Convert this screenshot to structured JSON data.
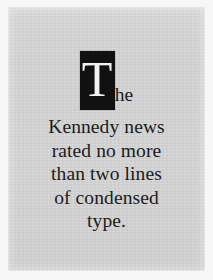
{
  "poster": {
    "plate_color": "#d2d2d2",
    "margin_color": "#f7f7f7",
    "ink_color": "#1b1b1b",
    "dropcap": {
      "letter": "T",
      "box_color": "#111111",
      "letter_color": "#f2f2f2"
    },
    "headline_full_text": "The Kennedy news rated no more than two lines of condensed type.",
    "lines": [
      {
        "id": "line-1",
        "text": "he"
      },
      {
        "id": "line-2",
        "text": "Kennedy news"
      },
      {
        "id": "line-3",
        "text": "rated no more"
      },
      {
        "id": "line-4",
        "text": "than two lines"
      },
      {
        "id": "line-5",
        "text": "of condensed"
      },
      {
        "id": "line-6",
        "text": "type."
      }
    ]
  }
}
